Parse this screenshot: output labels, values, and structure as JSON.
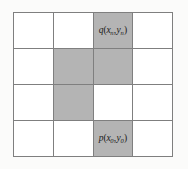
{
  "figure": {
    "type": "grid-raster-diagram",
    "background_color": "#fbfbfa",
    "gridline_color": "#7f7f7f",
    "cell_fill_color": "#ffffff",
    "shaded_cell_color": "#b4b4b4",
    "label_color": "#1a1a1a",
    "rows": 4,
    "columns": 4
  },
  "chart_data": {
    "type": "heatmap",
    "title": "",
    "xlabel": "",
    "ylabel": "",
    "rows": 4,
    "columns": 4,
    "legend": [],
    "grid": true,
    "cell_states": [
      [
        "empty",
        "empty",
        "shaded",
        "empty"
      ],
      [
        "empty",
        "shaded",
        "shaded",
        "empty"
      ],
      [
        "empty",
        "shaded",
        "empty",
        "empty"
      ],
      [
        "empty",
        "empty",
        "shaded",
        "empty"
      ]
    ],
    "shaded_cells": [
      {
        "row": 0,
        "col": 2
      },
      {
        "row": 1,
        "col": 1
      },
      {
        "row": 1,
        "col": 2
      },
      {
        "row": 2,
        "col": 1
      },
      {
        "row": 3,
        "col": 2
      }
    ],
    "annotations": [
      {
        "row": 0,
        "col": 2,
        "name": "endpoint-q",
        "function": "q",
        "x_var": "x",
        "x_sub": "n",
        "y_var": "y",
        "y_sub": "n"
      },
      {
        "row": 3,
        "col": 2,
        "name": "endpoint-p",
        "function": "p",
        "x_var": "x",
        "x_sub": "0",
        "y_var": "y",
        "y_sub": "0"
      }
    ]
  },
  "labels": {
    "q_point": {
      "fn": "q",
      "open": "(",
      "x_var": "x",
      "x_sub": "n",
      "comma": ",",
      "y_var": "y",
      "y_sub": "n",
      "close": ")"
    },
    "p_point": {
      "fn": "p",
      "open": "(",
      "x_var": "x",
      "x_sub": "0",
      "comma": ",",
      "y_var": "y",
      "y_sub": "0",
      "close": ")"
    }
  }
}
